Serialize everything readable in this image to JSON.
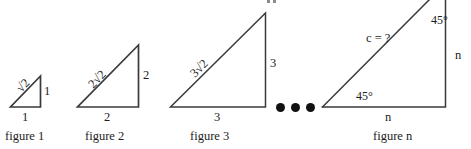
{
  "figure": {
    "dots_count": 3,
    "line_color": "#3a3a3a",
    "text_color": "#1c1c1c",
    "background": "#ffffff"
  },
  "triangles": [
    {
      "caption": "figure 1",
      "hypotenuse_label": "√2",
      "vertical_label": "1",
      "base_label": "1"
    },
    {
      "caption": "figure 2",
      "hypotenuse_label": "2√2",
      "vertical_label": "2",
      "base_label": "2"
    },
    {
      "caption": "figure 3",
      "hypotenuse_label": "3√2",
      "vertical_label": "3",
      "base_label": "3"
    },
    {
      "caption": "figure n",
      "hypotenuse_label": "c = ?",
      "vertical_label": "n",
      "base_label": "n",
      "angle_bottom": "45°",
      "angle_top": "45°"
    }
  ]
}
